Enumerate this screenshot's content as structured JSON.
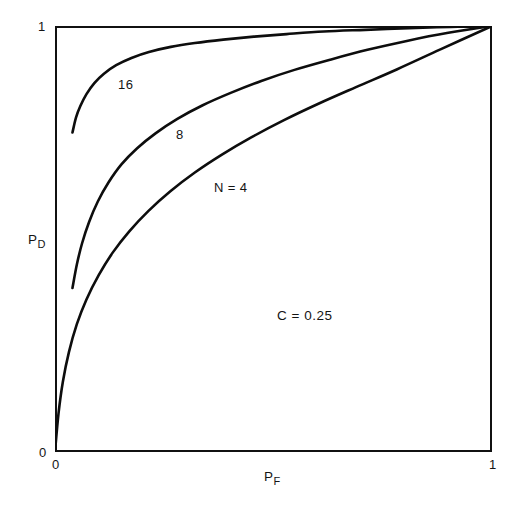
{
  "chart_data": {
    "type": "line",
    "title": "",
    "subtitle": "",
    "xlabel": "P_F",
    "xlabel_base": "P",
    "xlabel_sub": "F",
    "ylabel": "P_D",
    "ylabel_base": "P",
    "ylabel_sub": "D",
    "xlim": [
      0,
      1
    ],
    "ylim": [
      0,
      1
    ],
    "xticks": [
      0,
      1
    ],
    "yticks": [
      0,
      1
    ],
    "xtick_labels": [
      "0",
      "1"
    ],
    "ytick_labels": [
      "0",
      "1"
    ],
    "grid": false,
    "legend": "inline-curve-labels",
    "annotations": [
      {
        "name": "parameter-c",
        "text": "C = 0.25",
        "x": 0.51,
        "y": 0.335
      }
    ],
    "series": [
      {
        "name": "N = 16",
        "label": "16",
        "label_x": 0.145,
        "label_y": 0.855,
        "points": [
          [
            0.04,
            0.75
          ],
          [
            0.048,
            0.785
          ],
          [
            0.058,
            0.812
          ],
          [
            0.072,
            0.84
          ],
          [
            0.09,
            0.866
          ],
          [
            0.112,
            0.888
          ],
          [
            0.14,
            0.908
          ],
          [
            0.175,
            0.925
          ],
          [
            0.215,
            0.939
          ],
          [
            0.265,
            0.951
          ],
          [
            0.32,
            0.96
          ],
          [
            0.385,
            0.968
          ],
          [
            0.455,
            0.975
          ],
          [
            0.53,
            0.981
          ],
          [
            0.615,
            0.987
          ],
          [
            0.71,
            0.991
          ],
          [
            0.81,
            0.995
          ],
          [
            0.905,
            0.998
          ],
          [
            1.0,
            1.0
          ]
        ]
      },
      {
        "name": "N = 8",
        "label": "8",
        "label_x": 0.285,
        "label_y": 0.735,
        "points": [
          [
            0.04,
            0.385
          ],
          [
            0.05,
            0.44
          ],
          [
            0.062,
            0.49
          ],
          [
            0.078,
            0.54
          ],
          [
            0.098,
            0.588
          ],
          [
            0.122,
            0.632
          ],
          [
            0.152,
            0.675
          ],
          [
            0.188,
            0.713
          ],
          [
            0.23,
            0.748
          ],
          [
            0.28,
            0.782
          ],
          [
            0.338,
            0.814
          ],
          [
            0.402,
            0.843
          ],
          [
            0.472,
            0.871
          ],
          [
            0.548,
            0.897
          ],
          [
            0.63,
            0.921
          ],
          [
            0.715,
            0.944
          ],
          [
            0.805,
            0.965
          ],
          [
            0.9,
            0.984
          ],
          [
            1.0,
            1.0
          ]
        ]
      },
      {
        "name": "N = 4",
        "label": "N = 4",
        "label_x": 0.365,
        "label_y": 0.628,
        "points": [
          [
            0.0,
            0.0
          ],
          [
            0.008,
            0.09
          ],
          [
            0.018,
            0.165
          ],
          [
            0.032,
            0.235
          ],
          [
            0.05,
            0.3
          ],
          [
            0.072,
            0.358
          ],
          [
            0.1,
            0.415
          ],
          [
            0.132,
            0.468
          ],
          [
            0.17,
            0.518
          ],
          [
            0.214,
            0.566
          ],
          [
            0.264,
            0.612
          ],
          [
            0.32,
            0.656
          ],
          [
            0.382,
            0.698
          ],
          [
            0.45,
            0.739
          ],
          [
            0.524,
            0.779
          ],
          [
            0.604,
            0.818
          ],
          [
            0.69,
            0.857
          ],
          [
            0.782,
            0.898
          ],
          [
            0.882,
            0.945
          ],
          [
            1.0,
            1.0
          ]
        ]
      }
    ]
  },
  "axes": {
    "y_top_tick": "1",
    "y_bottom_tick": "0",
    "x_left_tick": "0",
    "x_right_tick": "1",
    "y_title_base": "P",
    "y_title_sub": "D",
    "x_title_base": "P",
    "x_title_sub": "F"
  },
  "labels": {
    "curve_16": "16",
    "curve_8": "8",
    "curve_n4": "N = 4",
    "parameter_c": "C = 0.25"
  },
  "colors": {
    "ink": "#111111",
    "background": "#ffffff"
  }
}
